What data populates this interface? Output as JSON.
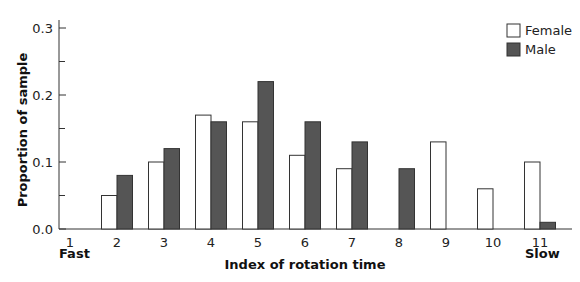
{
  "chart_data": {
    "type": "bar",
    "title": "",
    "xlabel": "Index of rotation time",
    "ylabel": "Proportion of sample",
    "categories": [
      "1",
      "2",
      "3",
      "4",
      "5",
      "6",
      "7",
      "8",
      "9",
      "10",
      "11"
    ],
    "x_end_labels": {
      "left": "Fast",
      "right": "Slow"
    },
    "ylim": [
      0,
      0.3
    ],
    "yticks": [
      "0.0",
      "0.1",
      "0.2",
      "0.3"
    ],
    "grid": false,
    "legend_position": "top-right",
    "series": [
      {
        "name": "Female",
        "color": "#ffffff",
        "values": [
          0,
          0.05,
          0.1,
          0.17,
          0.16,
          0.11,
          0.09,
          0,
          0.13,
          0.06,
          0.1
        ]
      },
      {
        "name": "Male",
        "color": "#555555",
        "values": [
          0,
          0.08,
          0.12,
          0.16,
          0.22,
          0.16,
          0.13,
          0.09,
          0,
          0,
          0.01
        ]
      }
    ]
  },
  "legend": {
    "female": "Female",
    "male": "Male"
  },
  "axis": {
    "xlabel": "Index of rotation time",
    "ylabel": "Proportion of sample",
    "fast": "Fast",
    "slow": "Slow"
  }
}
